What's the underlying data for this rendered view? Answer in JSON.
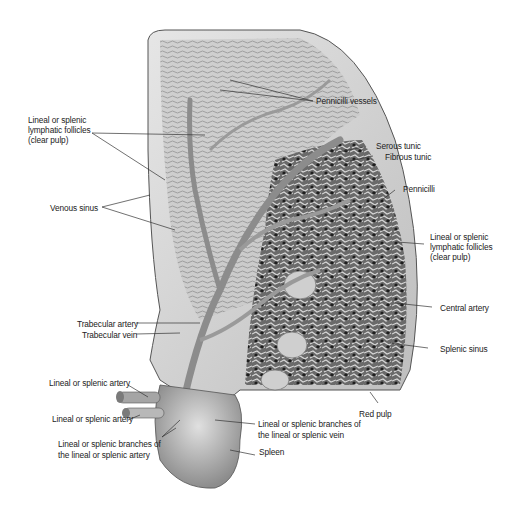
{
  "diagram": {
    "labels": {
      "pennicilli_vessels": "Pennicilli vessels",
      "lymphatic_left_1": "Lineal or splenic",
      "lymphatic_left_2": "lymphatic follicles",
      "lymphatic_left_3": "(clear pulp)",
      "serous_tunic": "Serous tunic",
      "fibrous_tunic": "Fibrous tunic",
      "pennicilli": "Pennicilli",
      "venous_sinus": "Venous sinus",
      "lymphatic_right_1": "Lineal or splenic",
      "lymphatic_right_2": "lymphatic follicles",
      "lymphatic_right_3": "(clear pulp)",
      "central_artery": "Central artery",
      "trabecular_artery": "Trabecular artery",
      "trabecular_vein": "Trabecular vein",
      "splenic_sinus": "Splenic sinus",
      "splenic_artery_upper": "Lineal or splenic artery",
      "splenic_artery_lower": "Lineal or splenic artery",
      "red_pulp": "Red pulp",
      "branches_vein_1": "Lineal or splenic branches of",
      "branches_vein_2": "the lineal or splenic vein",
      "branches_artery_1": "Lineal or splenic branches of",
      "branches_artery_2": "the lineal or splenic artery",
      "spleen": "Spleen"
    }
  }
}
